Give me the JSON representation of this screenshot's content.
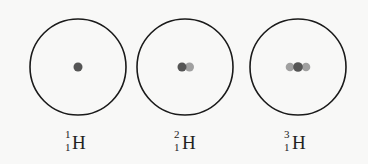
{
  "diagram": {
    "title": "",
    "atoms": [
      {
        "name": "protium",
        "label": {
          "mass": "1",
          "atomic": "1",
          "symbol": "H"
        },
        "center": [
          78,
          67
        ],
        "radius": 48,
        "nucleus": [
          {
            "type": "proton",
            "x": 78,
            "y": 67
          }
        ]
      },
      {
        "name": "deuterium",
        "label": {
          "mass": "2",
          "atomic": "1",
          "symbol": "H"
        },
        "center": [
          185,
          67
        ],
        "radius": 48,
        "nucleus": [
          {
            "type": "proton",
            "x": 182,
            "y": 67
          },
          {
            "type": "neutron",
            "x": 189,
            "y": 67
          }
        ]
      },
      {
        "name": "tritium",
        "label": {
          "mass": "3",
          "atomic": "1",
          "symbol": "H"
        },
        "center": [
          298,
          67
        ],
        "radius": 48,
        "nucleus": [
          {
            "type": "neutron",
            "x": 290,
            "y": 67
          },
          {
            "type": "proton",
            "x": 298,
            "y": 67
          },
          {
            "type": "neutron",
            "x": 306,
            "y": 67
          }
        ]
      }
    ],
    "colors": {
      "proton": "#555555",
      "neutron": "#9a9a9a",
      "orbit": "#1a1a1a",
      "background": "#f8f8f7"
    }
  }
}
